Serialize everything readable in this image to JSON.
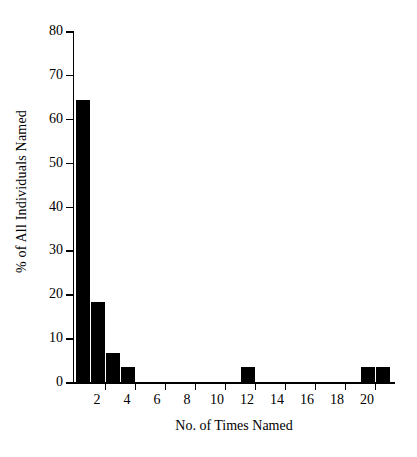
{
  "chart_data": {
    "type": "bar",
    "title": "",
    "subtitle": "",
    "xlabel": "No. of Times Named",
    "ylabel": "% of All Individuals Named",
    "categories": [
      1,
      2,
      3,
      4,
      5,
      6,
      7,
      8,
      9,
      10,
      11,
      12,
      13,
      14,
      15,
      16,
      17,
      18,
      19,
      20,
      21
    ],
    "values": [
      64.2,
      18.3,
      6.5,
      3.4,
      0,
      0,
      0,
      0,
      0,
      0,
      0,
      3.4,
      0,
      0,
      0,
      0,
      0,
      0,
      0,
      3.4,
      3.4
    ],
    "bar_color": "#000000",
    "xlim": [
      0.4,
      21.8
    ],
    "ylim": [
      0,
      80
    ],
    "xtick_values": [
      2,
      4,
      6,
      8,
      10,
      12,
      14,
      16,
      18,
      20
    ],
    "xtick_labels": [
      "2",
      "4",
      "6",
      "8",
      "10",
      "12",
      "14",
      "16",
      "18",
      "20"
    ],
    "ytick_values": [
      0,
      10,
      20,
      30,
      40,
      50,
      60,
      70,
      80
    ],
    "ytick_labels": [
      "0",
      "10",
      "20",
      "30",
      "40",
      "50",
      "60",
      "70",
      "80"
    ],
    "grid": false,
    "legend": false,
    "legend_position": "none",
    "axis_spines": [
      "left",
      "bottom"
    ],
    "tick_direction": "out",
    "annotations": []
  }
}
